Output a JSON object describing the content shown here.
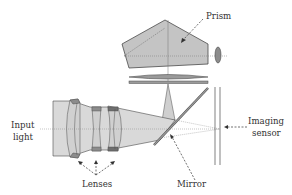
{
  "diagram": {
    "title": "",
    "labels": {
      "prism": "Prism",
      "input_light_line1": "Input",
      "input_light_line2": "light",
      "imaging_sensor_line1": "Imaging",
      "imaging_sensor_line2": "sensor",
      "lenses": "Lenses",
      "mirror": "Mirror"
    },
    "colors": {
      "light_fill": "#d9d9d9",
      "prism_fill": "#c4c4c4",
      "lens_dark": "#8c8c8c",
      "stroke": "#4a4a4a",
      "text": "#333333"
    }
  }
}
